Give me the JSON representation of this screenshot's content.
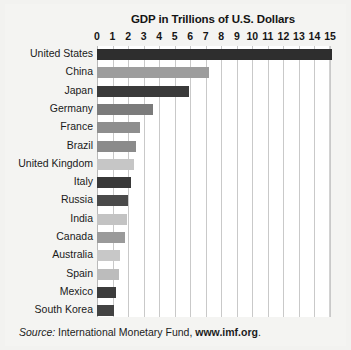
{
  "chart_data": {
    "type": "bar",
    "orientation": "horizontal",
    "title": "GDP in Trillions of U.S. Dollars",
    "xlabel": "",
    "ylabel": "",
    "xlim": [
      0,
      15
    ],
    "xticks": [
      0,
      1,
      2,
      3,
      4,
      5,
      6,
      7,
      8,
      9,
      10,
      11,
      12,
      13,
      14,
      15
    ],
    "xtick_labels": [
      "0",
      "1",
      "2",
      "3",
      "4",
      "5",
      "6",
      "7",
      "8",
      "9",
      "10",
      "11",
      "12",
      "13",
      "14",
      "15"
    ],
    "grid": true,
    "legend": false,
    "categories": [
      "United States",
      "China",
      "Japan",
      "Germany",
      "France",
      "Brazil",
      "United Kingdom",
      "Italy",
      "Russia",
      "India",
      "Canada",
      "Australia",
      "Spain",
      "Mexico",
      "South Korea"
    ],
    "values": [
      15.1,
      7.2,
      5.9,
      3.6,
      2.8,
      2.5,
      2.4,
      2.2,
      2.0,
      1.9,
      1.8,
      1.5,
      1.4,
      1.2,
      1.1
    ],
    "bar_colors": [
      "#2e2e2e",
      "#9d9d9d",
      "#3a3a3a",
      "#7b7b7b",
      "#8e8e8e",
      "#8b8b8b",
      "#c6c6c6",
      "#383838",
      "#4a4a4a",
      "#c3c3c3",
      "#9a9a9a",
      "#c8c8c8",
      "#bcbcbc",
      "#3c3c3c",
      "#434343"
    ]
  },
  "footer": {
    "source_label": "Source:",
    "source_name": " International Monetary Fund, ",
    "source_url": "www.imf.org",
    "trailing": "."
  }
}
